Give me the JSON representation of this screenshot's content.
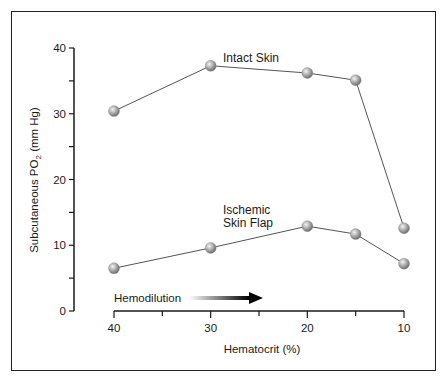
{
  "chart_data": {
    "type": "line",
    "title": "",
    "xlabel": "Hematocrit (%)",
    "ylabel": "Subcutaneous PO2 (mm Hg)",
    "ylabel_main": "Subcutaneous PO",
    "ylabel_sub": "2",
    "ylabel_tail": " (mm Hg)",
    "x": [
      40,
      30,
      20,
      15,
      10
    ],
    "xticks": [
      40,
      35,
      30,
      25,
      20,
      15,
      10
    ],
    "xticklabels": [
      "40",
      "30",
      "20",
      "10"
    ],
    "yticks": [
      0,
      5,
      10,
      15,
      20,
      25,
      30,
      35,
      40
    ],
    "yticklabels": [
      "0",
      "10",
      "20",
      "30",
      "40"
    ],
    "ylim": [
      0,
      40
    ],
    "xlim": [
      40,
      10
    ],
    "x_reversed": true,
    "grid": false,
    "legend": "none (inline labels)",
    "series": [
      {
        "name": "Intact Skin",
        "label_lines": [
          "Intact Skin"
        ],
        "values": [
          30.4,
          37.3,
          36.2,
          35.1,
          12.6
        ]
      },
      {
        "name": "Ischemic Skin Flap",
        "label_lines": [
          "Ischemic",
          "Skin Flap"
        ],
        "values": [
          6.5,
          9.6,
          12.9,
          11.7,
          7.2
        ]
      }
    ],
    "annotations": [
      {
        "text": "Hemodilution",
        "type": "arrow",
        "direction": "right"
      }
    ]
  },
  "colors": {
    "line": "#555555",
    "axis": "#1a1a1a",
    "marker_light": "#e8e8e8",
    "marker_dark": "#7a7a7a"
  }
}
